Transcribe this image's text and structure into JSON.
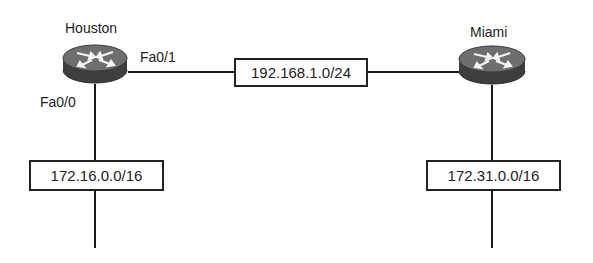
{
  "diagram": {
    "type": "network-topology",
    "routers": [
      {
        "name": "Houston",
        "interfaces": [
          "Fa0/1",
          "Fa0/0"
        ]
      },
      {
        "name": "Miami"
      }
    ],
    "labels": {
      "houston": "Houston",
      "miami": "Miami",
      "houston_fa01": "Fa0/1",
      "houston_fa00": "Fa0/0"
    },
    "networks": {
      "wan": "192.168.1.0/24",
      "houston_lan": "172.16.0.0/16",
      "miami_lan": "172.31.0.0/16"
    },
    "links": [
      {
        "from": "Houston Fa0/1",
        "to": "Miami",
        "network": "192.168.1.0/24"
      },
      {
        "from": "Houston Fa0/0",
        "to": "LAN",
        "network": "172.16.0.0/16"
      },
      {
        "from": "Miami",
        "to": "LAN",
        "network": "172.31.0.0/16"
      }
    ],
    "colors": {
      "line": "#1a1a1a",
      "router_body": "#4a4a4a",
      "router_top": "#7a7a7a",
      "background": "#ffffff"
    }
  }
}
